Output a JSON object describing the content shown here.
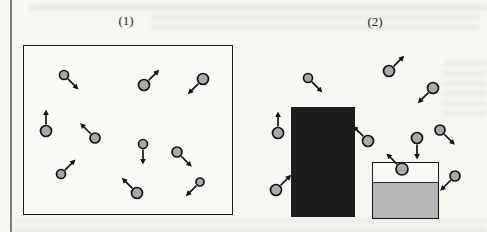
{
  "figure": {
    "type": "kinetic-molecular-diagram"
  },
  "colors": {
    "background": "#f7f6f1",
    "molecule_fill": "#a9a9a9",
    "molecule_stroke": "#121212",
    "arrow": "#121212",
    "solid_block": "#1d1d1d",
    "liquid_fill": "#b5b5b5",
    "box_border": "#1b1b1b",
    "page_rule": "#7d7d7d"
  },
  "diagram": {
    "panel1": {
      "label": "(1)",
      "box": {
        "x": 23,
        "y": 45,
        "w": 210,
        "h": 170
      },
      "particles": [
        {
          "x": 64,
          "y": 75,
          "r": 4.5,
          "angle": 45
        },
        {
          "x": 144,
          "y": 85,
          "r": 5.5,
          "angle": -45
        },
        {
          "x": 203,
          "y": 79,
          "r": 5.5,
          "angle": 135
        },
        {
          "x": 46,
          "y": 131,
          "r": 5.5,
          "angle": -90
        },
        {
          "x": 95,
          "y": 138,
          "r": 5,
          "angle": -135
        },
        {
          "x": 143,
          "y": 144,
          "r": 4.5,
          "angle": 90
        },
        {
          "x": 177,
          "y": 152,
          "r": 5,
          "angle": 45
        },
        {
          "x": 61,
          "y": 174,
          "r": 4.5,
          "angle": -45
        },
        {
          "x": 137,
          "y": 193,
          "r": 5.5,
          "angle": -135
        },
        {
          "x": 200,
          "y": 182,
          "r": 4,
          "angle": 135
        }
      ]
    },
    "panel2": {
      "label": "(2)",
      "solid_block": {
        "x": 291,
        "y": 107,
        "w": 64,
        "h": 110
      },
      "liquid_container": {
        "x": 372,
        "y": 162,
        "w": 67,
        "h": 57,
        "liquid_top": 183
      },
      "particles": [
        {
          "x": 308,
          "y": 78,
          "r": 4.5,
          "angle": 45
        },
        {
          "x": 389,
          "y": 71,
          "r": 5.5,
          "angle": -45
        },
        {
          "x": 433,
          "y": 88,
          "r": 5.5,
          "angle": 135
        },
        {
          "x": 278,
          "y": 133,
          "r": 5.5,
          "angle": -90
        },
        {
          "x": 368,
          "y": 141,
          "r": 5.5,
          "angle": -135
        },
        {
          "x": 440,
          "y": 130,
          "r": 5,
          "angle": 45
        },
        {
          "x": 417,
          "y": 138,
          "r": 5.5,
          "angle": 90
        },
        {
          "x": 276,
          "y": 190,
          "r": 5.5,
          "angle": -45
        },
        {
          "x": 402,
          "y": 169,
          "r": 6,
          "angle": -135
        },
        {
          "x": 455,
          "y": 176,
          "r": 5,
          "angle": 135
        }
      ]
    }
  }
}
